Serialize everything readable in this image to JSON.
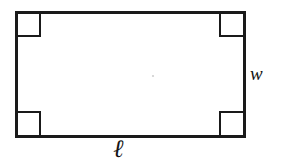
{
  "figure": {
    "kind": "geometry-diagram",
    "shape": "rectangle",
    "background_color": "#ffffff",
    "stroke_color": "#1a1a1a",
    "stroke_width_px": 3,
    "rectangle": {
      "x": 16,
      "y": 12,
      "width": 228,
      "height": 124
    },
    "right_angle_markers": {
      "count": 4,
      "size_px": 22,
      "positions": [
        "top-left",
        "top-right",
        "bottom-left",
        "bottom-right"
      ],
      "stroke_width_px": 2
    },
    "center_speck": {
      "x": 153,
      "y": 76,
      "radius_px": 1,
      "color": "#cfcfcf"
    }
  },
  "labels": {
    "length": {
      "text": "ℓ",
      "meaning": "length",
      "position": "below-bottom-edge"
    },
    "width": {
      "text": "w",
      "meaning": "width",
      "position": "right-of-right-edge"
    }
  }
}
